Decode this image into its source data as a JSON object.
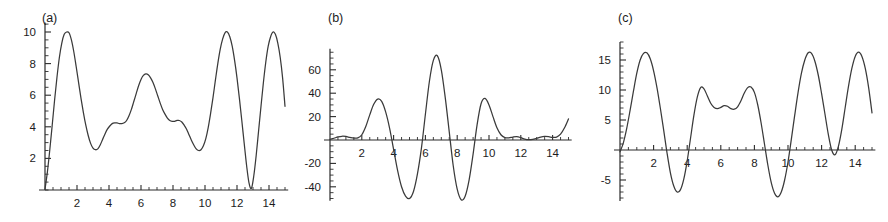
{
  "figure": {
    "background": "#ffffff",
    "curve_color": "#3a3a3a",
    "axis_color": "#2b2b2b",
    "panel_count": 3
  },
  "chart_data": [
    {
      "id": "panel-a",
      "type": "line",
      "title": "",
      "tag": "(a)",
      "xlabel": "",
      "ylabel": "",
      "xlim": [
        0,
        15.2
      ],
      "ylim": [
        0,
        10.6
      ],
      "grid": false,
      "legend": "none",
      "xticks": [
        2,
        4,
        6,
        8,
        10,
        12,
        14
      ],
      "xticklabels": [
        "2",
        "4",
        "6",
        "8",
        "10",
        "12",
        "14"
      ],
      "yticks": [
        2,
        4,
        6,
        8,
        10
      ],
      "yticklabels": [
        "2",
        "4",
        "6",
        "8",
        "10"
      ],
      "x_minor_step": 0.5,
      "y_minor_step": 0.5,
      "x": [
        0,
        0.15,
        0.3,
        0.45,
        0.6,
        0.75,
        0.9,
        1.05,
        1.2,
        1.35,
        1.5,
        1.65,
        1.8,
        1.95,
        2.1,
        2.25,
        2.4,
        2.55,
        2.7,
        2.85,
        3,
        3.15,
        3.3,
        3.45,
        3.6,
        3.75,
        3.9,
        4.05,
        4.2,
        4.35,
        4.5,
        4.65,
        4.8,
        4.95,
        5.1,
        5.25,
        5.4,
        5.55,
        5.7,
        5.85,
        6,
        6.15,
        6.3,
        6.45,
        6.6,
        6.75,
        6.9,
        7.05,
        7.2,
        7.35,
        7.5,
        7.65,
        7.8,
        7.95,
        8.1,
        8.25,
        8.4,
        8.55,
        8.7,
        8.85,
        9,
        9.15,
        9.3,
        9.45,
        9.6,
        9.75,
        9.9,
        10.05,
        10.2,
        10.35,
        10.5,
        10.65,
        10.8,
        10.95,
        11.1,
        11.25,
        11.4,
        11.55,
        11.7,
        11.85,
        12,
        12.15,
        12.3,
        12.45,
        12.6,
        12.75,
        12.9,
        13.05,
        13.2,
        13.35,
        13.5,
        13.65,
        13.8,
        13.95,
        14.1,
        14.25,
        14.4,
        14.55,
        14.7,
        14.85,
        15
      ],
      "y": [
        0.05,
        1.15,
        2.55,
        4.1,
        5.7,
        7.15,
        8.4,
        9.3,
        9.85,
        10.0,
        9.95,
        9.5,
        8.75,
        7.8,
        6.8,
        5.8,
        4.9,
        4.1,
        3.45,
        2.95,
        2.65,
        2.55,
        2.6,
        2.85,
        3.2,
        3.55,
        3.85,
        4.05,
        4.2,
        4.25,
        4.25,
        4.2,
        4.2,
        4.25,
        4.4,
        4.7,
        5.1,
        5.6,
        6.1,
        6.6,
        7.0,
        7.25,
        7.35,
        7.3,
        7.1,
        6.8,
        6.4,
        5.95,
        5.5,
        5.1,
        4.8,
        4.55,
        4.4,
        4.35,
        4.35,
        4.4,
        4.4,
        4.3,
        4.1,
        3.85,
        3.5,
        3.15,
        2.85,
        2.6,
        2.5,
        2.55,
        2.8,
        3.25,
        3.95,
        4.85,
        5.85,
        6.95,
        8.0,
        8.9,
        9.55,
        9.95,
        10.0,
        9.7,
        9.1,
        8.2,
        7.1,
        5.8,
        4.4,
        2.95,
        1.55,
        0.45,
        0.1,
        0.9,
        2.2,
        3.75,
        5.3,
        6.8,
        8.1,
        9.1,
        9.7,
        10.0,
        9.85,
        9.3,
        8.4,
        7.1,
        5.3
      ]
    },
    {
      "id": "panel-b",
      "type": "line",
      "title": "",
      "tag": "(b)",
      "xlabel": "",
      "ylabel": "",
      "xlim": [
        0,
        15.2
      ],
      "ylim": [
        -52,
        78
      ],
      "grid": false,
      "legend": "none",
      "xticks": [
        2,
        4,
        6,
        8,
        10,
        12,
        14
      ],
      "xticklabels": [
        "2",
        "4",
        "6",
        "8",
        "10",
        "12",
        "14"
      ],
      "yticks": [
        -40,
        -20,
        0,
        20,
        40,
        60
      ],
      "yticklabels": [
        "-40",
        "-20",
        "",
        "20",
        "40",
        "60"
      ],
      "x_minor_step": 0.5,
      "y_minor_step": 5,
      "x": [
        0,
        0.25,
        0.5,
        0.75,
        1,
        1.25,
        1.5,
        1.75,
        2,
        2.25,
        2.5,
        2.75,
        3,
        3.25,
        3.5,
        3.75,
        4,
        4.25,
        4.5,
        4.75,
        5,
        5.25,
        5.5,
        5.75,
        6,
        6.25,
        6.5,
        6.75,
        7,
        7.25,
        7.5,
        7.75,
        8,
        8.25,
        8.5,
        8.75,
        9,
        9.25,
        9.5,
        9.75,
        10,
        10.25,
        10.5,
        10.75,
        11,
        11.25,
        11.5,
        11.75,
        12,
        12.25,
        12.5,
        12.75,
        13,
        13.25,
        13.5,
        13.75,
        14,
        14.25,
        14.5,
        14.75,
        15
      ],
      "y": [
        0.5,
        1.5,
        2.6,
        3.2,
        3.0,
        2.2,
        1.6,
        1.8,
        4.5,
        11.5,
        21.5,
        30.5,
        35.0,
        33.0,
        24.0,
        10.0,
        -8.0,
        -26.0,
        -40.0,
        -48.0,
        -50.0,
        -44.0,
        -29.0,
        -7.0,
        22.0,
        50.0,
        68.0,
        72.0,
        60.0,
        36.0,
        7.0,
        -22.0,
        -42.0,
        -51.0,
        -48.0,
        -34.0,
        -12.0,
        13.0,
        31.0,
        35.5,
        30.0,
        20.0,
        10.5,
        4.5,
        2.0,
        1.8,
        2.5,
        2.8,
        2.0,
        0.8,
        0.3,
        0.6,
        1.5,
        2.5,
        3.0,
        2.8,
        2.2,
        2.5,
        5.0,
        10.5,
        18.0
      ]
    },
    {
      "id": "panel-c",
      "type": "line",
      "title": "",
      "tag": "(c)",
      "xlabel": "",
      "ylabel": "",
      "xlim": [
        0,
        15.2
      ],
      "ylim": [
        -8.5,
        18
      ],
      "grid": false,
      "legend": "none",
      "xticks": [
        2,
        4,
        6,
        8,
        10,
        12,
        14
      ],
      "xticklabels": [
        "2",
        "4",
        "6",
        "8",
        "10",
        "12",
        "14"
      ],
      "yticks": [
        -5,
        0,
        5,
        10,
        15
      ],
      "yticklabels": [
        "-5",
        "",
        "5",
        "10",
        "15"
      ],
      "x_minor_step": 0.5,
      "y_minor_step": 1,
      "x": [
        0,
        0.2,
        0.4,
        0.6,
        0.8,
        1,
        1.2,
        1.4,
        1.6,
        1.8,
        2,
        2.2,
        2.4,
        2.6,
        2.8,
        3,
        3.2,
        3.4,
        3.6,
        3.8,
        4,
        4.2,
        4.4,
        4.6,
        4.8,
        5,
        5.2,
        5.4,
        5.6,
        5.8,
        6,
        6.2,
        6.4,
        6.6,
        6.8,
        7,
        7.2,
        7.4,
        7.6,
        7.8,
        8,
        8.2,
        8.4,
        8.6,
        8.8,
        9,
        9.2,
        9.4,
        9.6,
        9.8,
        10,
        10.2,
        10.4,
        10.6,
        10.8,
        11,
        11.2,
        11.4,
        11.6,
        11.8,
        12,
        12.2,
        12.4,
        12.6,
        12.8,
        13,
        13.2,
        13.4,
        13.6,
        13.8,
        14,
        14.2,
        14.4,
        14.6,
        14.8,
        15
      ],
      "y": [
        -0.3,
        1.2,
        3.6,
        6.6,
        9.8,
        12.8,
        15.0,
        16.1,
        16.2,
        15.2,
        13.2,
        10.4,
        7.0,
        3.3,
        -0.5,
        -3.8,
        -6.0,
        -7.0,
        -6.6,
        -4.8,
        -1.8,
        2.0,
        5.8,
        8.8,
        10.4,
        10.2,
        9.0,
        7.8,
        7.1,
        6.9,
        7.1,
        7.4,
        7.3,
        6.9,
        6.8,
        7.2,
        8.2,
        9.5,
        10.4,
        10.5,
        9.6,
        7.5,
        4.5,
        1.0,
        -2.5,
        -5.4,
        -7.2,
        -7.8,
        -7.0,
        -5.0,
        -2.0,
        1.8,
        5.8,
        9.6,
        12.8,
        15.0,
        16.2,
        16.1,
        14.8,
        12.5,
        9.4,
        6.0,
        2.6,
        0.0,
        -0.8,
        0.6,
        3.4,
        7.0,
        10.6,
        13.6,
        15.6,
        16.3,
        15.6,
        13.6,
        10.4,
        6.2
      ]
    }
  ]
}
